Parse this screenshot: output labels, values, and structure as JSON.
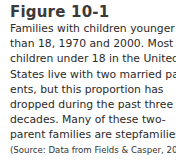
{
  "figure": {
    "title": "Figure 10-1",
    "caption_lines": [
      "Families with children younger",
      "than 18, 1970 and 2000. Most",
      "children under 18 in the United",
      "States live with two married par-",
      "ents, but this proportion has",
      "dropped during the past three",
      "decades. Many of these two-",
      "parent families are stepfamilies."
    ],
    "source": "(Source: Data from Fields & Casper, 2001.)"
  }
}
